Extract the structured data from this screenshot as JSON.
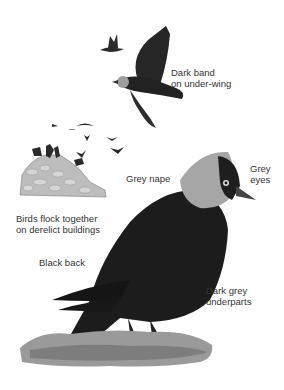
{
  "figure": {
    "colors": {
      "background": "#ffffff",
      "label_text": "#333333",
      "bird_black": "#1a1a1a",
      "bird_dark": "#2b2b2b",
      "nape_grey": "#a8a8a8",
      "grass": "#8a8a8a",
      "stone": "#b5b5b5"
    }
  },
  "labels": {
    "under_wing": [
      "Dark band",
      "on under-wing"
    ],
    "flock": [
      "Birds flock together",
      "on derelict buildings"
    ],
    "nape": "Grey nape",
    "eyes": [
      "Grey",
      "eyes"
    ],
    "back": "Black back",
    "underparts": [
      "Dark grey",
      "underparts"
    ]
  }
}
